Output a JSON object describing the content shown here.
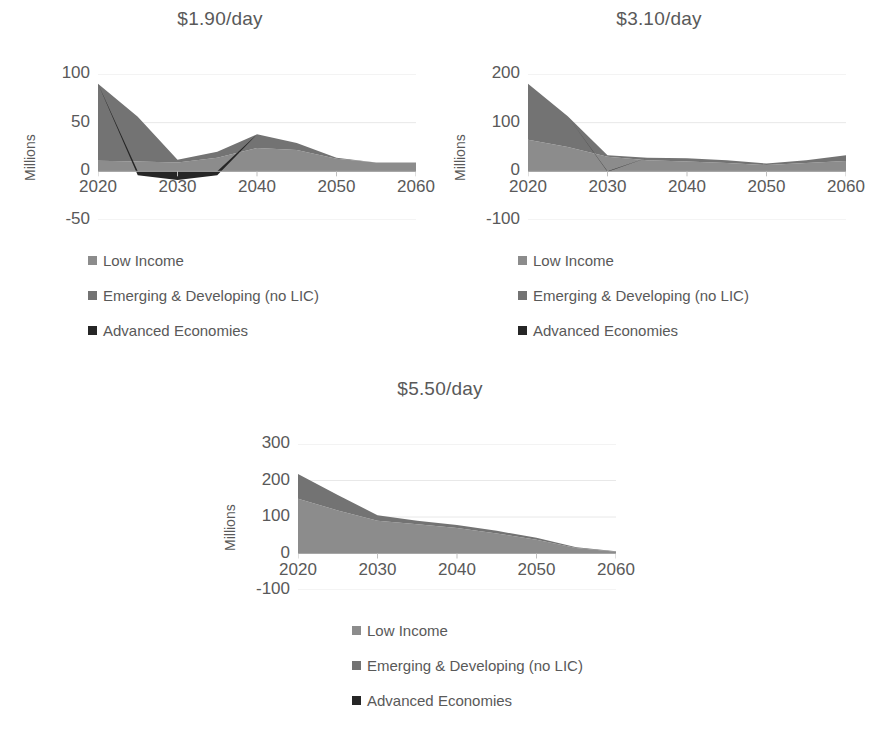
{
  "chart_data": [
    {
      "id": "chart-190",
      "type": "area",
      "stacked": true,
      "title": "$1.90/day",
      "xlabel": "",
      "ylabel": "Millions",
      "x": [
        2020,
        2025,
        2030,
        2035,
        2040,
        2045,
        2050,
        2055,
        2060
      ],
      "xticks": [
        "2020",
        "2030",
        "2040",
        "2050",
        "2060"
      ],
      "yticks": [
        "100",
        "50",
        "0",
        "-50"
      ],
      "ylim": [
        -50,
        100
      ],
      "grid": true,
      "legend_position": "bottom-left",
      "series": [
        {
          "name": "Low Income",
          "color": "#8C8C8C",
          "values": [
            11,
            10,
            9,
            14,
            24,
            22,
            13,
            9,
            9
          ]
        },
        {
          "name": "Emerging & Developing (no LIC)",
          "color": "#737373",
          "values": [
            79,
            46,
            3,
            6,
            14,
            7,
            1,
            0,
            0
          ]
        },
        {
          "name": "Advanced Economies",
          "color": "#262626",
          "values": [
            0,
            -4,
            -9,
            -4,
            0,
            0,
            0,
            0,
            0
          ]
        }
      ]
    },
    {
      "id": "chart-310",
      "type": "area",
      "stacked": true,
      "title": "$3.10/day",
      "xlabel": "",
      "ylabel": "Millions",
      "x": [
        2020,
        2025,
        2030,
        2035,
        2040,
        2045,
        2050,
        2055,
        2060
      ],
      "xticks": [
        "2020",
        "2030",
        "2040",
        "2050",
        "2060"
      ],
      "yticks": [
        "200",
        "100",
        "0",
        "-100"
      ],
      "ylim": [
        -100,
        200
      ],
      "grid": true,
      "legend_position": "bottom-left",
      "series": [
        {
          "name": "Low Income",
          "color": "#8C8C8C",
          "values": [
            65,
            50,
            30,
            23,
            20,
            17,
            13,
            17,
            21
          ]
        },
        {
          "name": "Emerging & Developing (no LIC)",
          "color": "#737373",
          "values": [
            115,
            63,
            3,
            5,
            7,
            6,
            3,
            6,
            12
          ]
        },
        {
          "name": "Advanced Economies",
          "color": "#262626",
          "values": [
            0,
            0,
            -1,
            0,
            0,
            0,
            0,
            0,
            0
          ]
        }
      ]
    },
    {
      "id": "chart-550",
      "type": "area",
      "stacked": true,
      "title": "$5.50/day",
      "xlabel": "",
      "ylabel": "Millions",
      "x": [
        2020,
        2025,
        2030,
        2035,
        2040,
        2045,
        2050,
        2055,
        2060
      ],
      "xticks": [
        "2020",
        "2030",
        "2040",
        "2050",
        "2060"
      ],
      "yticks": [
        "300",
        "200",
        "100",
        "0",
        "-100"
      ],
      "ylim": [
        -100,
        300
      ],
      "grid": true,
      "legend_position": "bottom-left",
      "series": [
        {
          "name": "Low Income",
          "color": "#8C8C8C",
          "values": [
            150,
            118,
            90,
            80,
            70,
            55,
            38,
            15,
            5
          ]
        },
        {
          "name": "Emerging & Developing (no LIC)",
          "color": "#737373",
          "values": [
            68,
            42,
            15,
            10,
            8,
            7,
            5,
            2,
            1
          ]
        },
        {
          "name": "Advanced Economies",
          "color": "#262626",
          "values": [
            0,
            0,
            0,
            0,
            0,
            0,
            0,
            0,
            0
          ]
        }
      ]
    }
  ],
  "legend": {
    "items": [
      {
        "label": "Low Income",
        "color": "#8C8C8C"
      },
      {
        "label": "Emerging & Developing (no LIC)",
        "color": "#737373"
      },
      {
        "label": "Advanced Economies",
        "color": "#262626"
      }
    ]
  }
}
